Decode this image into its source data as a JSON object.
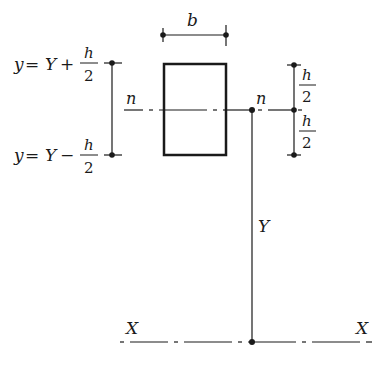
{
  "diagram": {
    "type": "cross-section geometry",
    "colors": {
      "ink": "#1a1a1a",
      "background": "#ffffff"
    },
    "labels": {
      "width": "b",
      "neutral_axis_left": "n",
      "neutral_axis_right": "n",
      "distance": "Y",
      "reference_axis_left": "X",
      "reference_axis_right": "X",
      "top_formula": {
        "lhs": "y",
        "eq": "=",
        "var": "Y",
        "op": "+",
        "num": "h",
        "den": "2"
      },
      "bottom_formula": {
        "lhs": "y",
        "eq": "=",
        "var": "Y",
        "op": "−",
        "num": "h",
        "den": "2"
      },
      "half_height_upper": {
        "num": "h",
        "den": "2"
      },
      "half_height_lower": {
        "num": "h",
        "den": "2"
      }
    },
    "rectangle": {
      "x": 164,
      "y": 64,
      "width": 62,
      "height": 91
    }
  }
}
